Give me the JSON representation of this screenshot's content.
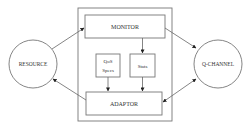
{
  "diagram": {
    "nodes": {
      "resource": {
        "label": "RESOURCE",
        "shape": "circle"
      },
      "q_channel": {
        "label": "Q-CHANNEL",
        "shape": "circle"
      },
      "monitor": {
        "label": "MONITOR",
        "shape": "rect"
      },
      "qos_specs": {
        "label_line1": "QoS",
        "label_line2": "Specs",
        "shape": "rect"
      },
      "stats": {
        "label": "Stats",
        "shape": "rect"
      },
      "adaptor": {
        "label": "ADAPTOR",
        "shape": "rect"
      },
      "container": {
        "label": "",
        "shape": "rect"
      }
    },
    "edges": [
      {
        "from": "RESOURCE",
        "to": "MONITOR",
        "direction": "forward"
      },
      {
        "from": "MONITOR",
        "to": "Q-CHANNEL",
        "direction": "forward"
      },
      {
        "from": "MONITOR",
        "to": "Stats",
        "direction": "forward"
      },
      {
        "from": "QoS Specs",
        "to": "ADAPTOR",
        "direction": "forward"
      },
      {
        "from": "Stats",
        "to": "ADAPTOR",
        "direction": "forward"
      },
      {
        "from": "ADAPTOR",
        "to": "RESOURCE",
        "direction": "forward"
      },
      {
        "from": "Q-CHANNEL",
        "to": "ADAPTOR",
        "direction": "bidirectional"
      }
    ],
    "colors": {
      "stroke": "#555555",
      "text": "#333333",
      "background": "#ffffff"
    }
  }
}
